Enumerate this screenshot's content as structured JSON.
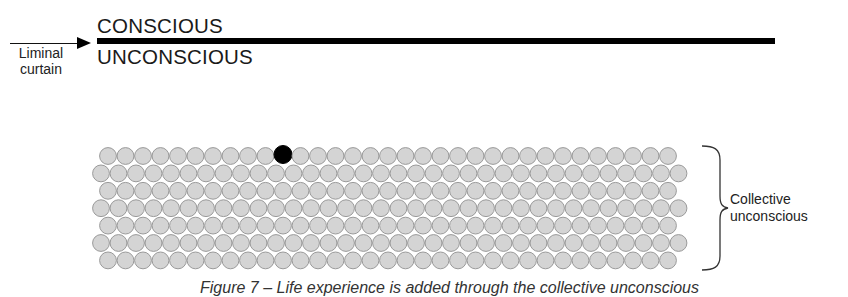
{
  "diagram": {
    "top_label": "CONSCIOUS",
    "bottom_label": "UNCONSCIOUS",
    "arrow_label_line1": "Liminal",
    "arrow_label_line2": "curtain",
    "brace_label_line1": "Collective",
    "brace_label_line2": "unconscious",
    "caption": "Figure 7 – Life experience is added through the collective unconscious",
    "grid": {
      "rows": 7,
      "odd_row_count": 33,
      "even_row_count": 34,
      "highlighted": {
        "row": 0,
        "index": 10
      },
      "circle_fill": "#d4d4d4",
      "circle_stroke": "#9a9a9a",
      "highlight_fill": "#000000"
    },
    "colors": {
      "line": "#000000",
      "text": "#1a1a1a"
    }
  }
}
